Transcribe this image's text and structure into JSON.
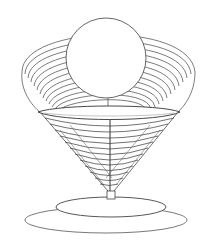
{
  "illustration": {
    "subject": "wire cone lamp with sphere on elliptical base",
    "colors": {
      "background": "#ffffff",
      "stroke": "#3a3a3a",
      "stroke_light": "#7a7a7a",
      "fill": "#ffffff"
    }
  }
}
